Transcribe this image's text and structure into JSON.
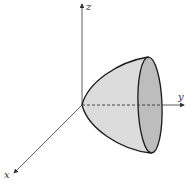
{
  "diagram": {
    "type": "3d-surface-sketch",
    "surface": "elliptic paraboloid opening along positive y-axis",
    "axes": [
      {
        "name": "z",
        "label": "z"
      },
      {
        "name": "y",
        "label": "y"
      },
      {
        "name": "x",
        "label": "x"
      }
    ],
    "colors": {
      "surface_fill": "#dcdcdc",
      "rim_fill": "#bdbdbd",
      "outline": "#1a1a1a",
      "axis": "#333333"
    }
  }
}
